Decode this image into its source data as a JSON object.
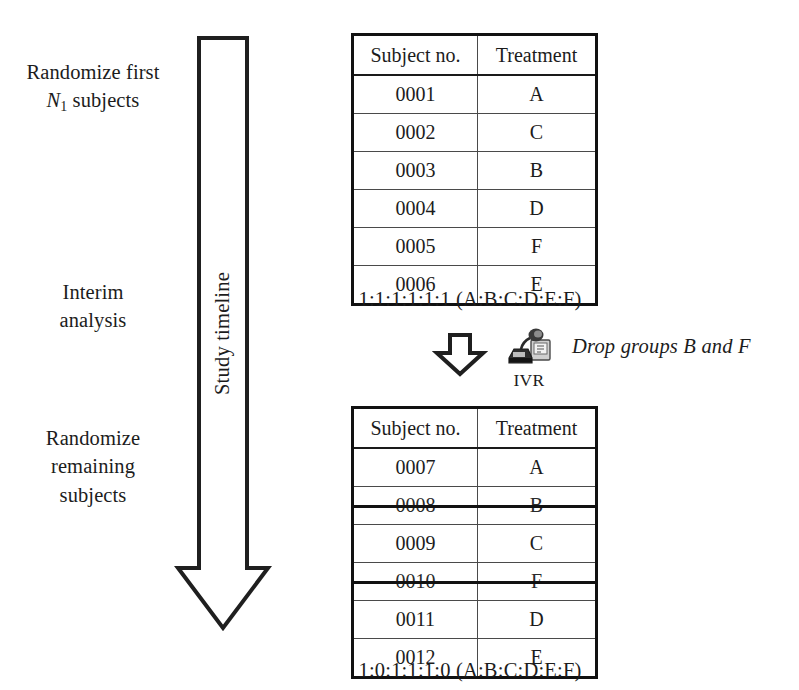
{
  "diagram": {
    "timeline": {
      "label": "Study timeline",
      "arrow_icon": "down-arrow-icon"
    },
    "stages": [
      {
        "id": "randomize-first",
        "line1": "Randomize first",
        "line2_prefix": "N",
        "line2_subscript": "1",
        "line2_suffix": " subjects"
      },
      {
        "id": "interim-analysis",
        "line1": "Interim",
        "line2": "analysis"
      },
      {
        "id": "randomize-remaining",
        "line1": "Randomize",
        "line2": "remaining",
        "line3": "subjects"
      }
    ],
    "tables": [
      {
        "id": "stage1",
        "headers": [
          "Subject no.",
          "Treatment"
        ],
        "rows": [
          {
            "subject": "0001",
            "treatment": "A",
            "dropped": false
          },
          {
            "subject": "0002",
            "treatment": "C",
            "dropped": false
          },
          {
            "subject": "0003",
            "treatment": "B",
            "dropped": false
          },
          {
            "subject": "0004",
            "treatment": "D",
            "dropped": false
          },
          {
            "subject": "0005",
            "treatment": "F",
            "dropped": false
          },
          {
            "subject": "0006",
            "treatment": "E",
            "dropped": false
          }
        ],
        "ratio_caption": "1:1:1:1:1:1 (A:B:C:D:E:F)"
      },
      {
        "id": "stage2",
        "headers": [
          "Subject no.",
          "Treatment"
        ],
        "rows": [
          {
            "subject": "0007",
            "treatment": "A",
            "dropped": false
          },
          {
            "subject": "0008",
            "treatment": "B",
            "dropped": true
          },
          {
            "subject": "0009",
            "treatment": "C",
            "dropped": false
          },
          {
            "subject": "0010",
            "treatment": "F",
            "dropped": true
          },
          {
            "subject": "0011",
            "treatment": "D",
            "dropped": false
          },
          {
            "subject": "0012",
            "treatment": "E",
            "dropped": false
          }
        ],
        "ratio_caption": "1:0:1:1:1:0 (A:B:C:D:E:F)"
      }
    ],
    "transition": {
      "arrow_icon": "down-arrow-icon",
      "ivr_icon": "telephone-ivr-icon",
      "ivr_label": "IVR",
      "note": "Drop groups B and F"
    },
    "colors": {
      "ink": "#1c1c1c",
      "rule": "#4a4a4a",
      "frame": "#111111",
      "background": "#ffffff"
    }
  }
}
